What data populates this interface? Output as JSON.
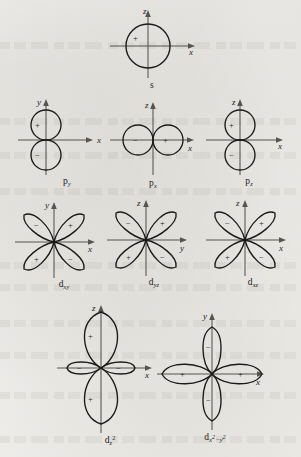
{
  "figure": {
    "background_color": "#f2f1ee",
    "ink_color": "#1b1a18",
    "axis_color": "#56544f",
    "sign_positive": "+",
    "sign_negative": "−"
  },
  "orbitals": [
    {
      "id": "s",
      "label_base": "s",
      "label_sub": "",
      "label_full": "s",
      "shape": "sphere",
      "axes": [
        {
          "name": "z",
          "direction": "up"
        },
        {
          "name": "x",
          "direction": "right"
        }
      ],
      "lobes": [
        {
          "name": "sphere-lobe",
          "sign": "+",
          "direction": "center"
        }
      ]
    },
    {
      "id": "p_y",
      "label_base": "p",
      "label_sub": "y",
      "label_full": "p_y",
      "shape": "two-circles-vertical",
      "axes": [
        {
          "name": "y",
          "direction": "up"
        },
        {
          "name": "x",
          "direction": "right"
        }
      ],
      "lobes": [
        {
          "name": "upper-lobe",
          "sign": "+",
          "direction": "up"
        },
        {
          "name": "lower-lobe",
          "sign": "−",
          "direction": "down"
        }
      ]
    },
    {
      "id": "p_x",
      "label_base": "p",
      "label_sub": "x",
      "label_full": "p_x",
      "shape": "two-circles-horizontal",
      "axes": [
        {
          "name": "z",
          "direction": "up"
        },
        {
          "name": "x",
          "direction": "right"
        }
      ],
      "lobes": [
        {
          "name": "left-lobe",
          "sign": "−",
          "direction": "left"
        },
        {
          "name": "right-lobe",
          "sign": "+",
          "direction": "right"
        }
      ]
    },
    {
      "id": "p_z",
      "label_base": "p",
      "label_sub": "z",
      "label_full": "p_z",
      "shape": "two-circles-vertical",
      "axes": [
        {
          "name": "z",
          "direction": "up"
        },
        {
          "name": "x",
          "direction": "right"
        }
      ],
      "lobes": [
        {
          "name": "upper-lobe",
          "sign": "+",
          "direction": "up"
        },
        {
          "name": "lower-lobe",
          "sign": "−",
          "direction": "down"
        }
      ]
    },
    {
      "id": "d_xy",
      "label_base": "d",
      "label_sub": "xy",
      "label_full": "d_xy",
      "shape": "four-lobe-diagonal",
      "axes": [
        {
          "name": "y",
          "direction": "up"
        },
        {
          "name": "x",
          "direction": "right"
        }
      ],
      "lobes": [
        {
          "name": "upper-left-lobe",
          "sign": "−",
          "direction": "upper-left"
        },
        {
          "name": "upper-right-lobe",
          "sign": "+",
          "direction": "upper-right"
        },
        {
          "name": "lower-left-lobe",
          "sign": "+",
          "direction": "lower-left"
        },
        {
          "name": "lower-right-lobe",
          "sign": "−",
          "direction": "lower-right"
        }
      ]
    },
    {
      "id": "d_yz",
      "label_base": "d",
      "label_sub": "yz",
      "label_full": "d_yz",
      "shape": "four-lobe-diagonal",
      "axes": [
        {
          "name": "z",
          "direction": "up"
        },
        {
          "name": "y",
          "direction": "right"
        }
      ],
      "lobes": [
        {
          "name": "upper-left-lobe",
          "sign": "−",
          "direction": "upper-left"
        },
        {
          "name": "upper-right-lobe",
          "sign": "+",
          "direction": "upper-right"
        },
        {
          "name": "lower-left-lobe",
          "sign": "+",
          "direction": "lower-left"
        },
        {
          "name": "lower-right-lobe",
          "sign": "−",
          "direction": "lower-right"
        }
      ]
    },
    {
      "id": "d_xz",
      "label_base": "d",
      "label_sub": "xz",
      "label_full": "d_xz",
      "shape": "four-lobe-diagonal",
      "axes": [
        {
          "name": "z",
          "direction": "up"
        },
        {
          "name": "x",
          "direction": "right"
        }
      ],
      "lobes": [
        {
          "name": "upper-left-lobe",
          "sign": "−",
          "direction": "upper-left"
        },
        {
          "name": "upper-right-lobe",
          "sign": "+",
          "direction": "upper-right"
        },
        {
          "name": "lower-left-lobe",
          "sign": "+",
          "direction": "lower-left"
        },
        {
          "name": "lower-right-lobe",
          "sign": "−",
          "direction": "lower-right"
        }
      ]
    },
    {
      "id": "d_z2",
      "label_base": "d",
      "label_sub": "z",
      "label_sup": "2",
      "label_full": "d_z2",
      "shape": "dz2",
      "axes": [
        {
          "name": "z",
          "direction": "up"
        },
        {
          "name": "x",
          "direction": "right"
        }
      ],
      "lobes": [
        {
          "name": "upper-lobe",
          "sign": "+",
          "direction": "up"
        },
        {
          "name": "lower-lobe",
          "sign": "+",
          "direction": "down"
        },
        {
          "name": "left-torus-lobe",
          "sign": "−",
          "direction": "left"
        },
        {
          "name": "right-torus-lobe",
          "sign": "−",
          "direction": "right"
        }
      ]
    },
    {
      "id": "d_x2y2",
      "label_base": "d",
      "label_sub_1": "x",
      "label_sup_1": "2",
      "label_dash": "−",
      "label_sub_2": "y",
      "label_sup_2": "2",
      "label_full": "d_x2-y2",
      "shape": "four-lobe-axial",
      "axes": [
        {
          "name": "y",
          "direction": "up"
        },
        {
          "name": "x",
          "direction": "right"
        }
      ],
      "lobes": [
        {
          "name": "upper-lobe",
          "sign": "−",
          "direction": "up"
        },
        {
          "name": "lower-lobe",
          "sign": "−",
          "direction": "down"
        },
        {
          "name": "left-lobe",
          "sign": "+",
          "direction": "left"
        },
        {
          "name": "right-lobe",
          "sign": "+",
          "direction": "right"
        }
      ]
    }
  ]
}
